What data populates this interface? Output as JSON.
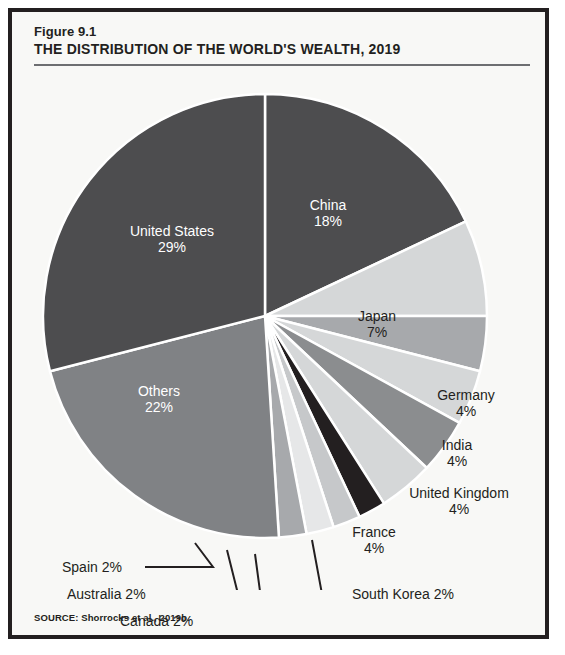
{
  "figure": {
    "number": "Figure 9.1",
    "title": "THE DISTRIBUTION OF THE WORLD'S WEALTH, 2019",
    "source": "SOURCE: Shorrocks et al., 2019b."
  },
  "chart_data": {
    "type": "pie",
    "title": "THE DISTRIBUTION OF THE WORLD'S WEALTH, 2019",
    "subtitle": "Figure 9.1",
    "source": "SOURCE: Shorrocks et al., 2019b.",
    "unit": "percent of world wealth",
    "start_angle_deg": -90,
    "direction": "clockwise",
    "legend": "none (direct labels)",
    "categories": [
      "China",
      "Japan",
      "Germany",
      "India",
      "United Kingdom",
      "France",
      "South Korea",
      "Canada",
      "Australia",
      "Spain",
      "Others",
      "United States"
    ],
    "values": [
      18,
      7,
      4,
      4,
      4,
      4,
      2,
      2,
      2,
      2,
      22,
      29
    ],
    "slices": [
      {
        "name": "China",
        "label": "China",
        "pct_text": "18%",
        "value": 18,
        "color": "#4d4d4f",
        "label_placement": "inside",
        "label_color": "#ffffff"
      },
      {
        "name": "Japan",
        "label": "Japan",
        "pct_text": "7%",
        "value": 7,
        "color": "#d5d7d8",
        "label_placement": "inside",
        "label_color": "#231f20"
      },
      {
        "name": "Germany",
        "label": "Germany",
        "pct_text": "4%",
        "value": 4,
        "color": "#a7a9ac",
        "label_placement": "outside",
        "label_color": "#231f20"
      },
      {
        "name": "India",
        "label": "India",
        "pct_text": "4%",
        "value": 4,
        "color": "#d5d7d8",
        "label_placement": "outside",
        "label_color": "#231f20"
      },
      {
        "name": "United Kingdom",
        "label": "United Kingdom",
        "pct_text": "4%",
        "value": 4,
        "color": "#8b8d8f",
        "label_placement": "outside",
        "label_color": "#231f20"
      },
      {
        "name": "France",
        "label": "France",
        "pct_text": "4%",
        "value": 4,
        "color": "#d5d7d8",
        "label_placement": "outside",
        "label_color": "#231f20"
      },
      {
        "name": "South Korea",
        "label": "South Korea 2%",
        "pct_text": "2%",
        "value": 2,
        "color": "#231f20",
        "label_placement": "callout",
        "label_color": "#231f20"
      },
      {
        "name": "Canada",
        "label": "Canada 2%",
        "pct_text": "2%",
        "value": 2,
        "color": "#c6c8ca",
        "label_placement": "callout",
        "label_color": "#231f20"
      },
      {
        "name": "Australia",
        "label": "Australia 2%",
        "pct_text": "2%",
        "value": 2,
        "color": "#e6e7e8",
        "label_placement": "callout",
        "label_color": "#231f20"
      },
      {
        "name": "Spain",
        "label": "Spain 2%",
        "pct_text": "2%",
        "value": 2,
        "color": "#a7a9ac",
        "label_placement": "callout",
        "label_color": "#231f20"
      },
      {
        "name": "Others",
        "label": "Others",
        "pct_text": "22%",
        "value": 22,
        "color": "#808285",
        "label_placement": "inside",
        "label_color": "#ffffff"
      },
      {
        "name": "United States",
        "label": "United States",
        "pct_text": "29%",
        "value": 29,
        "color": "#4d4d4f",
        "label_placement": "inside",
        "label_color": "#ffffff"
      }
    ]
  },
  "labels": {
    "china_name": "China",
    "china_pct": "18%",
    "united_states_name": "United States",
    "united_states_pct": "29%",
    "others_name": "Others",
    "others_pct": "22%",
    "japan_name": "Japan",
    "japan_pct": "7%",
    "germany_name": "Germany",
    "germany_pct": "4%",
    "india_name": "India",
    "india_pct": "4%",
    "united_kingdom_name": "United Kingdom",
    "united_kingdom_pct": "4%",
    "france_name": "France",
    "france_pct": "4%",
    "spain_callout": "Spain 2%",
    "australia_callout": "Australia 2%",
    "canada_callout": "Canada 2%",
    "south_korea_callout": "South Korea 2%"
  },
  "colors": {
    "frame": "#231f20",
    "background": "#f8f8f6",
    "rule": "#6d6e71",
    "slice_separator": "#ffffff",
    "dark": "#4d4d4f",
    "black": "#231f20",
    "mid": "#808285",
    "light": "#d5d7d8"
  }
}
